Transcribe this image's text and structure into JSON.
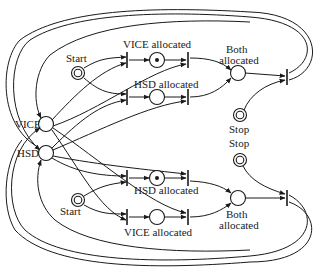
{
  "diagram": {
    "type": "petri-net",
    "colors": {
      "ink": "#1a1a1a",
      "background": "#ffffff"
    },
    "labels": {
      "vice": "VICE",
      "hsd": "HSD",
      "start_top": "Start",
      "start_bottom": "Start",
      "vice_alloc_top": "VICE allocated",
      "hsd_alloc_top": "HSD allocated",
      "both_top_1": "Both",
      "both_top_2": "allocated",
      "stop_top": "Stop",
      "stop_bottom": "Stop",
      "hsd_alloc_bottom": "HSD allocated",
      "vice_alloc_bottom": "VICE allocated",
      "both_bottom_1": "Both",
      "both_bottom_2": "allocated"
    },
    "places": [
      {
        "id": "vice",
        "label": "VICE",
        "tokens": 0
      },
      {
        "id": "hsd",
        "label": "HSD",
        "tokens": 0
      },
      {
        "id": "start_top",
        "label": "Start",
        "kind": "double"
      },
      {
        "id": "vice_alloc_top",
        "label": "VICE allocated",
        "tokens": 1
      },
      {
        "id": "hsd_alloc_top",
        "label": "HSD allocated",
        "tokens": 0
      },
      {
        "id": "both_top",
        "label": "Both allocated",
        "tokens": 0
      },
      {
        "id": "stop_top",
        "label": "Stop",
        "kind": "double"
      },
      {
        "id": "stop_bottom",
        "label": "Stop",
        "kind": "double"
      },
      {
        "id": "start_bottom",
        "label": "Start",
        "kind": "double"
      },
      {
        "id": "hsd_alloc_bottom",
        "label": "HSD allocated",
        "tokens": 1
      },
      {
        "id": "vice_alloc_bottom",
        "label": "VICE allocated",
        "tokens": 0
      },
      {
        "id": "both_bottom",
        "label": "Both allocated",
        "tokens": 0
      }
    ]
  }
}
